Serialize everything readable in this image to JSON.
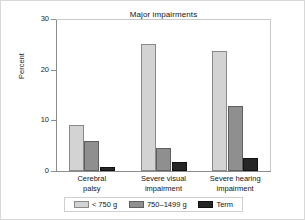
{
  "chart_data": {
    "type": "bar",
    "title": "Major impairments",
    "xlabel": "",
    "ylabel": "Percent",
    "ylim": [
      0,
      30
    ],
    "yticks": [
      0,
      10,
      20,
      30
    ],
    "ytick_labels": [
      "0",
      "10",
      "20",
      "30"
    ],
    "grid": false,
    "legend_position": "bottom",
    "categories": [
      "Cerebral palsy",
      "Severe visual impairment",
      "Severe hearing impairment"
    ],
    "category_lines": [
      [
        "Cerebral",
        "palsy"
      ],
      [
        "Severe visual",
        "impairment"
      ],
      [
        "Severe hearing",
        "impairment"
      ]
    ],
    "series": [
      {
        "name": "< 750 g",
        "color": "#d3d3d3",
        "values": [
          9.0,
          25.0,
          23.6
        ]
      },
      {
        "name": "750–1499 g",
        "color": "#8f8f8f",
        "values": [
          6.0,
          4.6,
          12.8
        ]
      },
      {
        "name": "Term",
        "color": "#262626",
        "values": [
          0.8,
          1.7,
          2.6
        ]
      }
    ]
  },
  "legend": {
    "items": [
      {
        "label": "< 750 g"
      },
      {
        "label": "750–1499 g"
      },
      {
        "label": "Term"
      }
    ]
  }
}
